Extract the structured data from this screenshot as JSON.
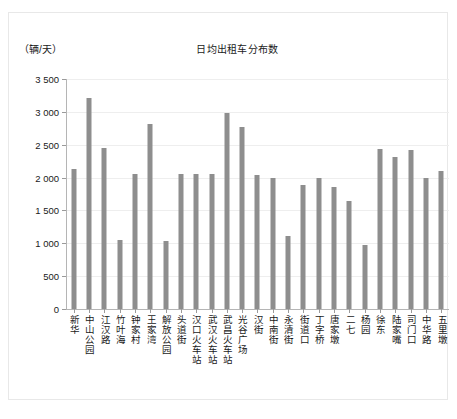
{
  "chart_data": {
    "type": "bar",
    "title": "日均出租车分布数",
    "unit_label": "（辆/天）",
    "xlabel": "",
    "ylabel": "",
    "ylim": [
      0,
      3500
    ],
    "ytick_step": 500,
    "ytick_labels": [
      "0",
      "500",
      "1 000",
      "1 500",
      "2 000",
      "2 500",
      "3 000",
      "3 500"
    ],
    "ytick_values": [
      0,
      500,
      1000,
      1500,
      2000,
      2500,
      3000,
      3500
    ],
    "grid": true,
    "legend": "none",
    "bar_color": "#8e8e8e",
    "categories": [
      "新华",
      "中山公园",
      "江汉路",
      "竹叶海",
      "钟家村",
      "王家湾",
      "解放公园",
      "头道街",
      "汉口火车站",
      "武汉火车站",
      "武昌火车站",
      "光谷广场",
      "汉街",
      "中南街",
      "永清街",
      "街道口",
      "丁字桥",
      "唐家墩",
      "二七",
      "杨园",
      "徐东",
      "陆家嘴",
      "司门口",
      "中华路",
      "五里墩"
    ],
    "values": [
      2130,
      3210,
      2450,
      1050,
      2060,
      2810,
      1040,
      2050,
      2050,
      2060,
      2990,
      2770,
      2040,
      2000,
      1110,
      1880,
      2000,
      1860,
      1650,
      970,
      2440,
      2320,
      2420,
      2000,
      2100
    ]
  }
}
